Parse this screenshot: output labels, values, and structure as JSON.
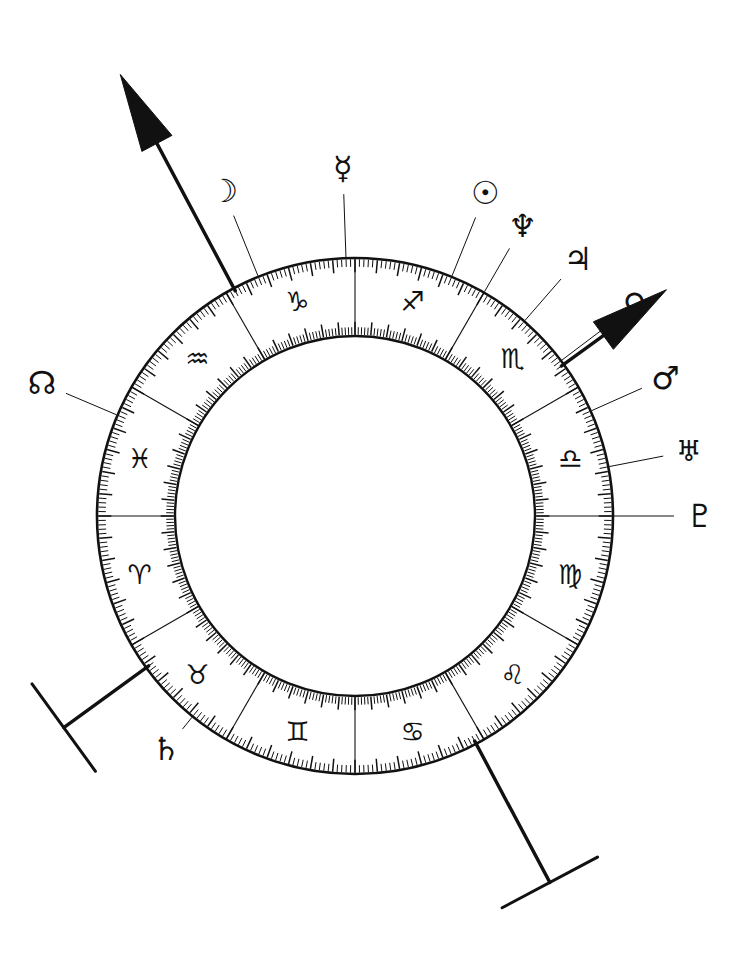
{
  "chart": {
    "kind": "astrological-natal-wheel",
    "center": {
      "x": 355,
      "y": 516
    },
    "radii": {
      "outer": 258,
      "inner": 180,
      "tick_outer": 12,
      "tick_inner": 12
    },
    "ink_color": "#111111",
    "background_color": "#ffffff",
    "degrees_per_sign": 30,
    "zodiac_start_angle_deg": -90,
    "signs": [
      {
        "name": "Capricorn",
        "glyph": "♑",
        "center_deg": -105,
        "order": 1
      },
      {
        "name": "Aquarius",
        "glyph": "♒",
        "center_deg": -135,
        "order": 2
      },
      {
        "name": "Pisces",
        "glyph": "♓",
        "center_deg": -165,
        "order": 3
      },
      {
        "name": "Aries",
        "glyph": "♈",
        "center_deg": 165,
        "order": 4
      },
      {
        "name": "Taurus",
        "glyph": "♉",
        "center_deg": 135,
        "order": 5
      },
      {
        "name": "Gemini",
        "glyph": "♊",
        "center_deg": 105,
        "order": 6
      },
      {
        "name": "Cancer",
        "glyph": "♋",
        "center_deg": 75,
        "order": 7
      },
      {
        "name": "Leo",
        "glyph": "♌",
        "center_deg": 45,
        "order": 8
      },
      {
        "name": "Virgo",
        "glyph": "♍",
        "center_deg": 15,
        "order": 9
      },
      {
        "name": "Libra",
        "glyph": "♎",
        "center_deg": -15,
        "order": 10
      },
      {
        "name": "Scorpio",
        "glyph": "♏",
        "center_deg": -45,
        "order": 11
      },
      {
        "name": "Sagittarius",
        "glyph": "♐",
        "center_deg": -75,
        "order": 12
      }
    ],
    "planets": [
      {
        "name": "Moon",
        "glyph": "☽",
        "angle_deg": -112,
        "label_radius": 350,
        "size": "normal"
      },
      {
        "name": "Mercury",
        "glyph": "☿",
        "angle_deg": -92,
        "label_radius": 348,
        "size": "normal"
      },
      {
        "name": "Sun",
        "glyph": "☉",
        "angle_deg": -68,
        "label_radius": 348,
        "size": "normal"
      },
      {
        "name": "Neptune",
        "glyph": "♆",
        "angle_deg": -60,
        "label_radius": 335,
        "size": "normal"
      },
      {
        "name": "Jupiter",
        "glyph": "♃",
        "angle_deg": -49,
        "label_radius": 340,
        "size": "normal"
      },
      {
        "name": "Venus",
        "glyph": "♀",
        "angle_deg": -37,
        "label_radius": 350,
        "size": "normal"
      },
      {
        "name": "Mars",
        "glyph": "♂",
        "angle_deg": -24,
        "label_radius": 340,
        "size": "normal"
      },
      {
        "name": "Uranus",
        "glyph": "♅",
        "angle_deg": -11,
        "label_radius": 340,
        "size": "small"
      },
      {
        "name": "Pluto",
        "glyph": "♇",
        "angle_deg": 0,
        "label_radius": 345,
        "size": "normal"
      },
      {
        "name": "North Node",
        "glyph": "☊",
        "angle_deg": -157,
        "label_radius": 340,
        "size": "normal"
      },
      {
        "name": "Saturn",
        "glyph": "♄",
        "angle_deg": 129,
        "label_radius": 300,
        "size": "normal"
      }
    ],
    "axes": [
      {
        "name": "Midheaven",
        "abbr": "MC",
        "angle_deg": -118,
        "terminus": "arrow",
        "length": 500
      },
      {
        "name": "Ascendant",
        "abbr": "ASC",
        "angle_deg": -36,
        "terminus": "arrow",
        "length": 385
      },
      {
        "name": "Imum Coeli",
        "abbr": "IC",
        "angle_deg": 62,
        "terminus": "bar",
        "length": 415
      },
      {
        "name": "Descendant",
        "abbr": "DSC",
        "angle_deg": 144,
        "terminus": "bar",
        "length": 360
      }
    ]
  }
}
